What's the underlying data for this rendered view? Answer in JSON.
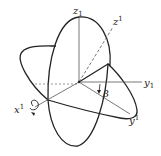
{
  "figure": {
    "labels": {
      "z_axis": {
        "base": "z",
        "index": "1",
        "index_type": "subscript"
      },
      "z_prime": {
        "base": "z",
        "index": "1",
        "index_type": "superscript"
      },
      "y_axis": {
        "base": "y",
        "index": "1",
        "index_type": "subscript"
      },
      "y_prime": {
        "base": "y",
        "index": "1",
        "index_type": "superscript"
      },
      "x_prime": {
        "base": "x",
        "index": "1",
        "index_type": "superscript"
      },
      "angle": "β"
    },
    "colors": {
      "stroke": "#222222",
      "axis": "#555555",
      "background": "#ffffff"
    }
  }
}
